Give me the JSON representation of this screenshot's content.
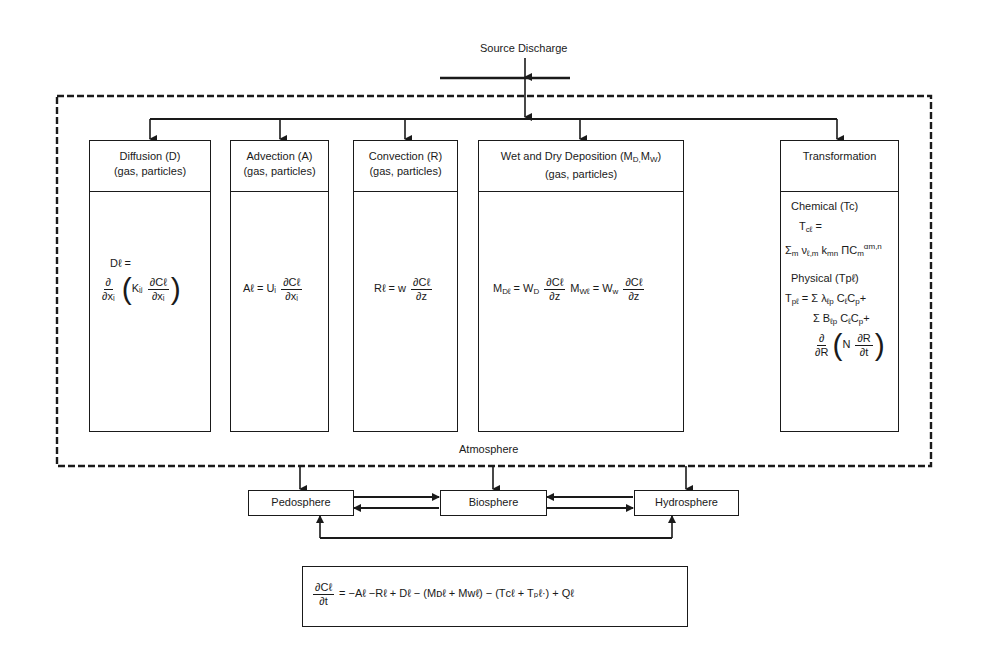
{
  "source": {
    "label": "Source Discharge"
  },
  "atmosphere": {
    "label": "Atmosphere"
  },
  "processes": [
    {
      "title": "Diffusion (D)",
      "subtitle": "(gas, particles)",
      "equation": {
        "lhs": "Dℓ =",
        "outer_num": "∂",
        "outer_den": "∂xᵢ",
        "coef": "Kᵢⱼ",
        "inner_num": "∂Cℓ",
        "inner_den": "∂xᵢ"
      }
    },
    {
      "title": "Advection (A)",
      "subtitle": "(gas, particles)",
      "equation": {
        "lhs": "Aℓ = Uᵢ",
        "num": "∂Cℓ",
        "den": "∂xᵢ"
      }
    },
    {
      "title": "Convection (R)",
      "subtitle": "(gas, particles)",
      "equation": {
        "lhs": "Rℓ = w",
        "num": "∂Cℓ",
        "den": "∂z"
      }
    },
    {
      "title": "Wet and Dry Deposition (M",
      "title_sub": "D,",
      "title_sub2": "W",
      "title_mid": "M",
      "title_end": ")",
      "subtitle": "(gas, particles)",
      "equation": {
        "lhs1": "M",
        "lhs1_sub": "Dℓ",
        "eq1": "= W",
        "eq1_sub": "D",
        "num1": "∂Cℓ",
        "den1": "∂z",
        "lhs2": "M",
        "lhs2_sub": "Wℓ",
        "eq2": "= W",
        "eq2_sub": "w",
        "num2": "∂Cℓ",
        "den2": "∂z"
      }
    },
    {
      "title": "Transformation",
      "subtitle": "",
      "chemical": {
        "label": "Chemical (Tc)",
        "lhs": "T",
        "lhs_sub": "cℓ",
        "lhs_eq": "=",
        "sum": "Σ",
        "sum_sub": "m",
        "term": "ν",
        "term_sub": "ℓ,m",
        "k": "k",
        "k_sub": "m",
        "k_subsub": "n",
        "prod": "Π",
        "c": "C",
        "c_sub": "m",
        "c_sup": "αm,n"
      },
      "physical": {
        "label": "Physical (Tpℓ)",
        "line1_lhs": "T",
        "line1_lhs_sub": "pℓ",
        "line1": "= Σ λ",
        "line1_sub": "ℓp",
        "line1_c": "C",
        "line1_c_sub": "ℓ",
        "line1_c2": "C",
        "line1_c2_sub": "p",
        "line1_end": "+",
        "line2": "Σ B",
        "line2_sub": "ℓp",
        "line2_c": "C",
        "line2_c_sub": "ℓ",
        "line2_c2": "C",
        "line2_c2_sub": "p",
        "line2_end": "+",
        "line3_num": "∂",
        "line3_den": "∂R",
        "line3_coef": "N",
        "line3_inner_num": "∂R",
        "line3_inner_den": "∂t"
      }
    }
  ],
  "spheres": [
    {
      "label": "Pedosphere"
    },
    {
      "label": "Biosphere"
    },
    {
      "label": "Hydrosphere"
    }
  ],
  "master_equation": {
    "num": "∂Cℓ",
    "den": "∂t",
    "rhs": "= −Aℓ −Rℓ + Dℓ − (Mᴅℓ + Mᴡℓ) − (Tᴄℓ + Tₚℓ·) + Qℓ"
  },
  "colors": {
    "ink": "#1a1a1a",
    "background": "#ffffff"
  }
}
